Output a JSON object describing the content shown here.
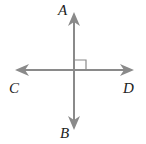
{
  "diagram": {
    "type": "perpendicular-lines",
    "colors": {
      "line": "#8a8a8a",
      "label": "#222222",
      "background": "#ffffff"
    },
    "labels": {
      "top": "A",
      "bottom": "B",
      "left": "C",
      "right": "D"
    },
    "lines": [
      {
        "name": "AB",
        "orientation": "vertical",
        "endpoints": [
          "A",
          "B"
        ]
      },
      {
        "name": "CD",
        "orientation": "horizontal",
        "endpoints": [
          "C",
          "D"
        ]
      }
    ],
    "right_angle_marker": true
  }
}
